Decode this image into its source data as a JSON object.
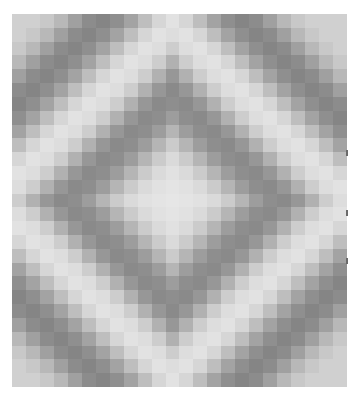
{
  "image": {
    "description": "Grayscale pixelated concentric-diamond (trip-around-the-world) quilt pattern",
    "background": "#ffffff"
  },
  "quilt": {
    "cols": 24,
    "rows": 27,
    "center_col": 11.6,
    "center_row": 13.8,
    "palette_by_distance": [
      "#e6e6e6",
      "#e4e4e4",
      "#e1e1e1",
      "#dadada",
      "#cbcbcb",
      "#b5b5b5",
      "#9d9d9d",
      "#8e8e8e",
      "#8a8a8a",
      "#979797",
      "#b1b1b1",
      "#cdcdcd",
      "#dddddd",
      "#e2e2e2",
      "#d6d6d6",
      "#bebebe",
      "#a3a3a3",
      "#8f8f8f",
      "#858585",
      "#8c8c8c",
      "#a0a0a0",
      "#b8b8b8",
      "#c8c8c8",
      "#d0d0d0"
    ]
  },
  "edge_marks": [
    {
      "y": 150
    },
    {
      "y": 210
    },
    {
      "y": 258
    }
  ]
}
